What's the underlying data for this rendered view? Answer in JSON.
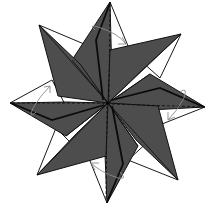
{
  "diagram": {
    "colors": {
      "dark_face": "#4d4d4d",
      "light_face": "#ffffff",
      "outline": "#111111",
      "arrow": "#8a8a8a"
    },
    "center": [
      108,
      103
    ],
    "dark_points": [
      {
        "name": "top",
        "tip": [
          110,
          2
        ]
      },
      {
        "name": "upper-right",
        "tip": [
          181,
          34
        ]
      },
      {
        "name": "right",
        "tip": [
          205,
          107
        ]
      },
      {
        "name": "lower-right",
        "tip": [
          178,
          180
        ]
      },
      {
        "name": "bottom",
        "tip": [
          107,
          203
        ]
      },
      {
        "name": "lower-left",
        "tip": [
          37,
          175
        ]
      },
      {
        "name": "left",
        "tip": [
          10,
          103
        ]
      },
      {
        "name": "upper-left",
        "tip": [
          39,
          25
        ]
      }
    ],
    "fold_arrows": [
      {
        "position": "top",
        "direction": "clockwise"
      },
      {
        "position": "right",
        "direction": "clockwise"
      },
      {
        "position": "bottom",
        "direction": "clockwise"
      },
      {
        "position": "left",
        "direction": "clockwise"
      }
    ],
    "legend": {
      "dashed_line": "valley fold",
      "curved_arrow": "fold direction"
    }
  }
}
